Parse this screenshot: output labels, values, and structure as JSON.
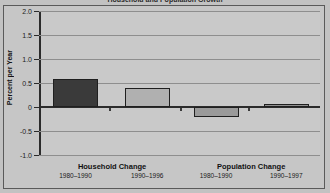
{
  "figure": {
    "cropped_title": "Household and Population Growth",
    "background_color": "#c2c2c2",
    "plot_background_color": "#c9c9c9",
    "border_color": "#5a5a5a"
  },
  "chart_data": {
    "type": "bar",
    "title": "Household and Population Growth",
    "xlabel": "",
    "ylabel": "Percent per Year",
    "ylim": [
      -1.0,
      2.0
    ],
    "ytick_labels": [
      "2.0",
      "1.5",
      "1.0",
      "0.5",
      "0",
      "-0.5",
      "-1.0"
    ],
    "ytick_values": [
      2.0,
      1.5,
      1.0,
      0.5,
      0,
      -0.5,
      -1.0
    ],
    "grid": true,
    "legend": "none",
    "groups": [
      {
        "label": "Household Change",
        "center_pct": 26.0
      },
      {
        "label": "Population Change",
        "center_pct": 75.5
      }
    ],
    "categories": [
      "1980–1990",
      "1990–1996",
      "1980–1990",
      "1990–1997"
    ],
    "values": [
      0.58,
      0.4,
      -0.21,
      0.07
    ],
    "bar_colors": [
      "#3a3a3a",
      "#b0b0b0",
      "#9a9a9a",
      "#8f8f8f"
    ],
    "bar_edge_color": "#1f1f1f",
    "bars": [
      {
        "label": "1980–1990",
        "group": "Household Change",
        "value": 0.58,
        "color": "#3a3a3a",
        "left_pct": 5.0,
        "width_pct": 16.0
      },
      {
        "label": "1990–1996",
        "group": "Household Change",
        "value": 0.4,
        "color": "#b0b0b0",
        "left_pct": 30.5,
        "width_pct": 16.0
      },
      {
        "label": "1980–1990",
        "group": "Population Change",
        "value": -0.21,
        "color": "#9a9a9a",
        "left_pct": 55.0,
        "width_pct": 16.0
      },
      {
        "label": "1990–1997",
        "group": "Population Change",
        "value": 0.07,
        "color": "#8f8f8f",
        "left_pct": 80.0,
        "width_pct": 16.0
      }
    ],
    "minor_ticks_pct": [
      25.0,
      50.0,
      74.5
    ]
  }
}
